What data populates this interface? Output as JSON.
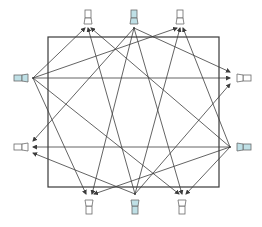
{
  "diagram": {
    "type": "speaker-room-connection-diagram",
    "room": {
      "x": 48,
      "y": 37,
      "width": 171,
      "height": 150,
      "stroke": "#3a3a3a"
    },
    "colors": {
      "line": "#3c3c3c",
      "source_fill": "#bfe0e6",
      "target_fill": "#ffffff",
      "icon_stroke": "#6a6a6a"
    },
    "nodes": [
      {
        "id": "top-left",
        "x": 88,
        "y": 18,
        "orient": "up",
        "role": "target",
        "anchor": [
          88,
          28
        ]
      },
      {
        "id": "top-center",
        "x": 134,
        "y": 18,
        "orient": "up",
        "role": "source",
        "anchor": [
          134,
          28
        ]
      },
      {
        "id": "top-right",
        "x": 180,
        "y": 18,
        "orient": "up",
        "role": "target",
        "anchor": [
          180,
          28
        ]
      },
      {
        "id": "left-upper",
        "x": 22,
        "y": 78,
        "orient": "left",
        "role": "source",
        "anchor": [
          33,
          78
        ]
      },
      {
        "id": "left-lower",
        "x": 22,
        "y": 147,
        "orient": "left",
        "role": "target",
        "anchor": [
          33,
          147
        ]
      },
      {
        "id": "right-upper",
        "x": 243,
        "y": 78,
        "orient": "right",
        "role": "target",
        "anchor": [
          230,
          78
        ]
      },
      {
        "id": "right-lower",
        "x": 243,
        "y": 147,
        "orient": "right",
        "role": "source",
        "anchor": [
          230,
          147
        ]
      },
      {
        "id": "bottom-left",
        "x": 89,
        "y": 206,
        "orient": "down",
        "role": "target",
        "anchor": [
          89,
          194
        ]
      },
      {
        "id": "bottom-center",
        "x": 135,
        "y": 206,
        "orient": "down",
        "role": "source",
        "anchor": [
          135,
          194
        ]
      },
      {
        "id": "bottom-right",
        "x": 182,
        "y": 206,
        "orient": "down",
        "role": "target",
        "anchor": [
          182,
          194
        ]
      }
    ],
    "edges": [
      {
        "from": [
          33,
          78
        ],
        "to": [
          85,
          28
        ]
      },
      {
        "from": [
          33,
          78
        ],
        "to": [
          177,
          28
        ]
      },
      {
        "from": [
          33,
          78
        ],
        "to": [
          230,
          78
        ]
      },
      {
        "from": [
          33,
          78
        ],
        "to": [
          86,
          194
        ]
      },
      {
        "from": [
          33,
          78
        ],
        "to": [
          179,
          194
        ]
      },
      {
        "from": [
          134,
          28
        ],
        "to": [
          33,
          141
        ]
      },
      {
        "from": [
          134,
          28
        ],
        "to": [
          92,
          194
        ]
      },
      {
        "from": [
          134,
          28
        ],
        "to": [
          230,
          72
        ]
      },
      {
        "from": [
          134,
          28
        ],
        "to": [
          182,
          194
        ]
      },
      {
        "from": [
          230,
          147
        ],
        "to": [
          33,
          147
        ]
      },
      {
        "from": [
          230,
          147
        ],
        "to": [
          183,
          28
        ]
      },
      {
        "from": [
          230,
          147
        ],
        "to": [
          91,
          28
        ]
      },
      {
        "from": [
          230,
          147
        ],
        "to": [
          94,
          194
        ]
      },
      {
        "from": [
          230,
          147
        ],
        "to": [
          186,
          194
        ]
      },
      {
        "from": [
          135,
          194
        ],
        "to": [
          88,
          28
        ]
      },
      {
        "from": [
          135,
          194
        ],
        "to": [
          180,
          28
        ]
      },
      {
        "from": [
          135,
          194
        ],
        "to": [
          33,
          153
        ]
      },
      {
        "from": [
          135,
          194
        ],
        "to": [
          230,
          84
        ]
      }
    ]
  }
}
